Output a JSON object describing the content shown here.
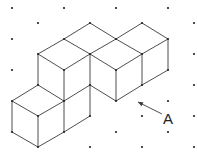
{
  "diagram": {
    "type": "isometric-dot-grid-cubes",
    "background": "#ffffff",
    "line_color": "#3a3a3a",
    "dot_color": "#222222",
    "label": "A",
    "grid_dots": [
      [
        12,
        8
      ],
      [
        64,
        8
      ],
      [
        116,
        8
      ],
      [
        168,
        8
      ],
      [
        38,
        23
      ],
      [
        194,
        23
      ],
      [
        12,
        39
      ],
      [
        194,
        54
      ],
      [
        12,
        70
      ],
      [
        194,
        85
      ],
      [
        168,
        101
      ],
      [
        142,
        116
      ],
      [
        194,
        116
      ],
      [
        116,
        132
      ],
      [
        168,
        132
      ],
      [
        90,
        147
      ],
      [
        142,
        147
      ],
      [
        194,
        147
      ]
    ],
    "vertices": [
      [
        90,
        23
      ],
      [
        142,
        23
      ],
      [
        64,
        39
      ],
      [
        116,
        39
      ],
      [
        168,
        39
      ],
      [
        38,
        54
      ],
      [
        90,
        54
      ],
      [
        142,
        54
      ],
      [
        64,
        70
      ],
      [
        116,
        70
      ],
      [
        168,
        70
      ],
      [
        38,
        85
      ],
      [
        90,
        85
      ],
      [
        142,
        85
      ],
      [
        12,
        101
      ],
      [
        64,
        101
      ],
      [
        116,
        101
      ],
      [
        38,
        116
      ],
      [
        90,
        116
      ],
      [
        12,
        132
      ],
      [
        64,
        132
      ],
      [
        38,
        147
      ]
    ],
    "edges": [
      [
        [
          90,
          23
        ],
        [
          64,
          39
        ]
      ],
      [
        [
          90,
          23
        ],
        [
          116,
          39
        ]
      ],
      [
        [
          64,
          39
        ],
        [
          38,
          54
        ]
      ],
      [
        [
          64,
          39
        ],
        [
          90,
          54
        ]
      ],
      [
        [
          38,
          54
        ],
        [
          64,
          70
        ]
      ],
      [
        [
          64,
          70
        ],
        [
          90,
          54
        ]
      ],
      [
        [
          116,
          39
        ],
        [
          90,
          54
        ]
      ],
      [
        [
          116,
          39
        ],
        [
          142,
          23
        ]
      ],
      [
        [
          142,
          23
        ],
        [
          168,
          39
        ]
      ],
      [
        [
          116,
          39
        ],
        [
          142,
          54
        ]
      ],
      [
        [
          142,
          54
        ],
        [
          168,
          39
        ]
      ],
      [
        [
          90,
          54
        ],
        [
          116,
          70
        ]
      ],
      [
        [
          116,
          70
        ],
        [
          142,
          54
        ]
      ],
      [
        [
          38,
          54
        ],
        [
          38,
          85
        ]
      ],
      [
        [
          64,
          70
        ],
        [
          64,
          101
        ]
      ],
      [
        [
          90,
          54
        ],
        [
          90,
          116
        ]
      ],
      [
        [
          116,
          70
        ],
        [
          116,
          101
        ]
      ],
      [
        [
          142,
          54
        ],
        [
          142,
          85
        ]
      ],
      [
        [
          168,
          39
        ],
        [
          168,
          70
        ]
      ],
      [
        [
          90,
          85
        ],
        [
          116,
          101
        ]
      ],
      [
        [
          116,
          101
        ],
        [
          142,
          85
        ]
      ],
      [
        [
          142,
          85
        ],
        [
          168,
          70
        ]
      ],
      [
        [
          38,
          85
        ],
        [
          64,
          101
        ]
      ],
      [
        [
          12,
          101
        ],
        [
          38,
          85
        ]
      ],
      [
        [
          12,
          101
        ],
        [
          38,
          116
        ]
      ],
      [
        [
          38,
          116
        ],
        [
          64,
          101
        ]
      ],
      [
        [
          64,
          101
        ],
        [
          90,
          85
        ]
      ],
      [
        [
          12,
          101
        ],
        [
          12,
          132
        ]
      ],
      [
        [
          38,
          116
        ],
        [
          38,
          147
        ]
      ],
      [
        [
          64,
          101
        ],
        [
          64,
          132
        ]
      ],
      [
        [
          12,
          132
        ],
        [
          38,
          147
        ]
      ],
      [
        [
          38,
          147
        ],
        [
          64,
          132
        ]
      ],
      [
        [
          64,
          132
        ],
        [
          90,
          116
        ]
      ]
    ],
    "arrow": {
      "from": [
        162,
        114
      ],
      "to": [
        138,
        102
      ]
    },
    "label_position": [
      163,
      124
    ]
  }
}
